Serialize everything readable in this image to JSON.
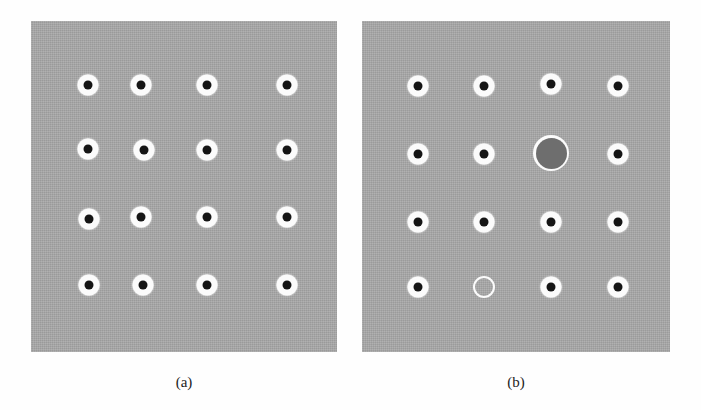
{
  "figure": {
    "background_color": "#ffffff",
    "panel_color": "#a8a8a8",
    "marker_halo_color": "#fbfbfb",
    "marker_core_color": "#151515",
    "large_disc_color": "#6e6e6e",
    "width": 701,
    "height": 410
  },
  "panels": [
    {
      "id": "a",
      "caption": "(a)",
      "description": "Regular 4 by 4 array of identical filled markers",
      "rect": {
        "x": 31,
        "y": 21,
        "w": 306,
        "h": 331
      },
      "columns_x": [
        88,
        141,
        207,
        287
      ],
      "rows_y": [
        85,
        143,
        219,
        285
      ],
      "markers": [
        {
          "row": 1,
          "col": 1,
          "x": 88,
          "y": 85,
          "type": "filled"
        },
        {
          "row": 1,
          "col": 2,
          "x": 141,
          "y": 85,
          "type": "filled"
        },
        {
          "row": 1,
          "col": 3,
          "x": 207,
          "y": 85,
          "type": "filled"
        },
        {
          "row": 1,
          "col": 4,
          "x": 287,
          "y": 85,
          "type": "filled"
        },
        {
          "row": 2,
          "col": 1,
          "x": 88,
          "y": 149,
          "type": "filled"
        },
        {
          "row": 2,
          "col": 2,
          "x": 144,
          "y": 150,
          "type": "filled"
        },
        {
          "row": 2,
          "col": 3,
          "x": 207,
          "y": 150,
          "type": "filled"
        },
        {
          "row": 2,
          "col": 4,
          "x": 287,
          "y": 150,
          "type": "filled"
        },
        {
          "row": 3,
          "col": 1,
          "x": 89,
          "y": 219,
          "type": "filled"
        },
        {
          "row": 3,
          "col": 2,
          "x": 141,
          "y": 217,
          "type": "filled"
        },
        {
          "row": 3,
          "col": 3,
          "x": 207,
          "y": 217,
          "type": "filled"
        },
        {
          "row": 3,
          "col": 4,
          "x": 287,
          "y": 217,
          "type": "filled"
        },
        {
          "row": 4,
          "col": 1,
          "x": 89,
          "y": 285,
          "type": "filled"
        },
        {
          "row": 4,
          "col": 2,
          "x": 143,
          "y": 285,
          "type": "filled"
        },
        {
          "row": 4,
          "col": 3,
          "x": 207,
          "y": 285,
          "type": "filled"
        },
        {
          "row": 4,
          "col": 4,
          "x": 287,
          "y": 285,
          "type": "filled"
        }
      ]
    },
    {
      "id": "b",
      "caption": "(b)",
      "description": "Same array with one oversized dark disc and one empty outlined site",
      "rect": {
        "x": 362,
        "y": 21,
        "w": 308,
        "h": 331
      },
      "columns_x": [
        418,
        484,
        552,
        618
      ],
      "rows_y": [
        86,
        154,
        222,
        287
      ],
      "markers": [
        {
          "row": 1,
          "col": 1,
          "x": 418,
          "y": 86,
          "type": "filled"
        },
        {
          "row": 1,
          "col": 2,
          "x": 484,
          "y": 86,
          "type": "filled"
        },
        {
          "row": 1,
          "col": 3,
          "x": 551,
          "y": 84,
          "type": "filled"
        },
        {
          "row": 1,
          "col": 4,
          "x": 618,
          "y": 86,
          "type": "filled"
        },
        {
          "row": 2,
          "col": 1,
          "x": 418,
          "y": 154,
          "type": "filled"
        },
        {
          "row": 2,
          "col": 2,
          "x": 484,
          "y": 154,
          "type": "filled"
        },
        {
          "row": 2,
          "col": 3,
          "x": 551,
          "y": 153,
          "type": "large-dark-disc"
        },
        {
          "row": 2,
          "col": 4,
          "x": 618,
          "y": 154,
          "type": "filled"
        },
        {
          "row": 3,
          "col": 1,
          "x": 418,
          "y": 222,
          "type": "filled"
        },
        {
          "row": 3,
          "col": 2,
          "x": 484,
          "y": 222,
          "type": "filled"
        },
        {
          "row": 3,
          "col": 3,
          "x": 551,
          "y": 222,
          "type": "filled"
        },
        {
          "row": 3,
          "col": 4,
          "x": 618,
          "y": 222,
          "type": "filled"
        },
        {
          "row": 4,
          "col": 1,
          "x": 418,
          "y": 287,
          "type": "filled"
        },
        {
          "row": 4,
          "col": 2,
          "x": 484,
          "y": 287,
          "type": "hollow-ring"
        },
        {
          "row": 4,
          "col": 3,
          "x": 551,
          "y": 287,
          "type": "filled"
        },
        {
          "row": 4,
          "col": 4,
          "x": 618,
          "y": 287,
          "type": "filled"
        }
      ]
    }
  ]
}
